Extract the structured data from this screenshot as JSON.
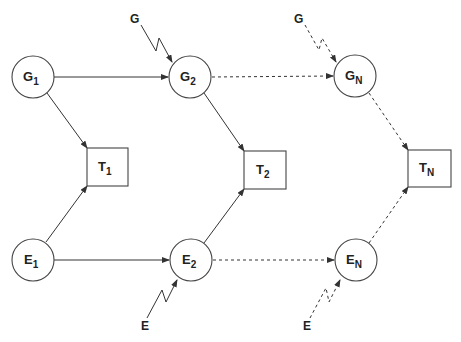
{
  "diagram": {
    "type": "flow-graph",
    "colors": {
      "stroke": "#333333",
      "background": "#ffffff",
      "text": "#222222"
    },
    "nodes": {
      "G1": {
        "base": "G",
        "sub": "1",
        "shape": "circle"
      },
      "G2": {
        "base": "G",
        "sub": "2",
        "shape": "circle"
      },
      "GN": {
        "base": "G",
        "sub": "N",
        "shape": "circle"
      },
      "T1": {
        "base": "T",
        "sub": "1",
        "shape": "box"
      },
      "T2": {
        "base": "T",
        "sub": "2",
        "shape": "box"
      },
      "TN": {
        "base": "T",
        "sub": "N",
        "shape": "box"
      },
      "E1": {
        "base": "E",
        "sub": "1",
        "shape": "circle"
      },
      "E2": {
        "base": "E",
        "sub": "2",
        "shape": "circle"
      },
      "EN": {
        "base": "E",
        "sub": "N",
        "shape": "circle"
      }
    },
    "external_inputs": {
      "g_to_G2": {
        "label": "G",
        "style": "solid-zigzag"
      },
      "g_to_GN": {
        "label": "G",
        "style": "dashed-zigzag"
      },
      "e_to_E2": {
        "label": "E",
        "style": "solid-zigzag"
      },
      "e_to_EN": {
        "label": "E",
        "style": "dashed-zigzag"
      }
    },
    "edges": [
      {
        "from": "G1",
        "to": "G2",
        "style": "solid"
      },
      {
        "from": "G2",
        "to": "GN",
        "style": "dashed"
      },
      {
        "from": "E1",
        "to": "E2",
        "style": "solid"
      },
      {
        "from": "E2",
        "to": "EN",
        "style": "dashed"
      },
      {
        "from": "G1",
        "to": "T1",
        "style": "solid"
      },
      {
        "from": "E1",
        "to": "T1",
        "style": "solid"
      },
      {
        "from": "G2",
        "to": "T2",
        "style": "solid"
      },
      {
        "from": "E2",
        "to": "T2",
        "style": "solid"
      },
      {
        "from": "GN",
        "to": "TN",
        "style": "dashed"
      },
      {
        "from": "EN",
        "to": "TN",
        "style": "dashed"
      }
    ]
  }
}
